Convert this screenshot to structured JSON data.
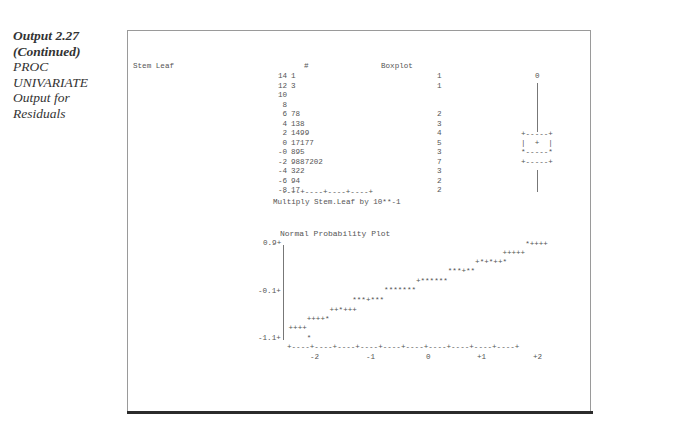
{
  "caption": {
    "line1": "Output 2.27",
    "line2": "(Continued)",
    "line3": "PROC",
    "line4": "UNIVARIATE",
    "line5": "Output for",
    "line6": "Residuals"
  },
  "stem_leaf": {
    "header_left": "Stem Leaf",
    "header_count": "#",
    "header_boxplot": "Boxplot",
    "rows": [
      {
        "stem": "14",
        "leaf": "1",
        "count": "1"
      },
      {
        "stem": "12",
        "leaf": "3",
        "count": "1"
      },
      {
        "stem": "10",
        "leaf": "",
        "count": ""
      },
      {
        "stem": "8",
        "leaf": "",
        "count": ""
      },
      {
        "stem": "6",
        "leaf": "78",
        "count": "2"
      },
      {
        "stem": "4",
        "leaf": "138",
        "count": "3"
      },
      {
        "stem": "2",
        "leaf": "1499",
        "count": "4"
      },
      {
        "stem": "0",
        "leaf": "17177",
        "count": "5"
      },
      {
        "stem": "-0",
        "leaf": "895",
        "count": "3"
      },
      {
        "stem": "-2",
        "leaf": "9887202",
        "count": "7"
      },
      {
        "stem": "-4",
        "leaf": "322",
        "count": "3"
      },
      {
        "stem": "-6",
        "leaf": "94",
        "count": "2"
      },
      {
        "stem": "-8",
        "leaf": "17",
        "count": "2"
      }
    ],
    "axis_line": "----+----+----+----+",
    "footnote": "Multiply Stem.Leaf by 10**-1"
  },
  "boxplot": {
    "outlier_symbol": "0",
    "box_top": "+-----+",
    "box_mid": "|  +  |",
    "box_median": "*-----*",
    "box_bottom": "+-----+"
  },
  "normal_plot": {
    "title": "Normal Probability Plot",
    "y_labels": [
      "0.9+",
      "-0.1+",
      "-1.1+"
    ],
    "x_axis": "+----+----+----+----+----+----+----+----+----+----+",
    "x_labels": [
      "-2",
      "-1",
      "0",
      "+1",
      "+2"
    ],
    "rows": [
      {
        "text": "*++++",
        "col": 53
      },
      {
        "text": "+++++",
        "col": 48
      },
      {
        "text": "+*+*++*",
        "col": 42
      },
      {
        "text": "***+**",
        "col": 36
      },
      {
        "text": "+******",
        "col": 29
      },
      {
        "text": "*******",
        "col": 22
      },
      {
        "text": "***+***",
        "col": 15
      },
      {
        "text": "++*+++",
        "col": 10
      },
      {
        "text": "++++*",
        "col": 5
      },
      {
        "text": "++++",
        "col": 1
      },
      {
        "text": "*",
        "col": 5
      }
    ]
  }
}
